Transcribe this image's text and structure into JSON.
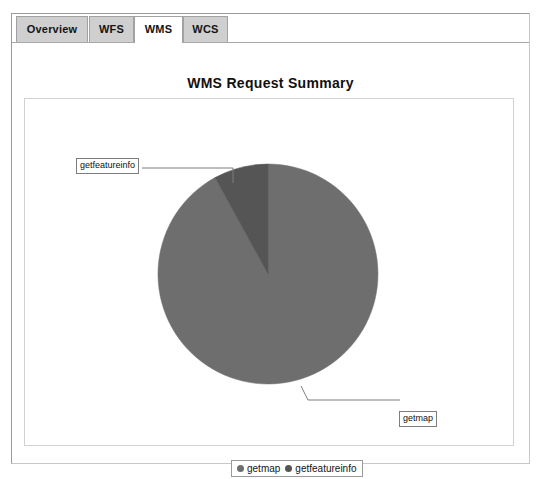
{
  "window": {
    "tabs": [
      {
        "id": "overview",
        "label": "Overview",
        "active": false
      },
      {
        "id": "wfs",
        "label": "WFS",
        "active": false
      },
      {
        "id": "wms",
        "label": "WMS",
        "active": true
      },
      {
        "id": "wcs",
        "label": "WCS",
        "active": false
      }
    ]
  },
  "chart": {
    "title": "WMS Request Summary",
    "callouts": {
      "getfeatureinfo": "getfeatureinfo",
      "getmap": "getmap"
    },
    "legend": [
      {
        "label": "getmap",
        "color": "#6e6e6e"
      },
      {
        "label": "getfeatureinfo",
        "color": "#555555"
      }
    ]
  },
  "chart_data": {
    "type": "pie",
    "title": "WMS Request Summary",
    "categories": [
      "getmap",
      "getfeatureinfo"
    ],
    "values": [
      92,
      8
    ],
    "units": "percent",
    "colors": [
      "#6e6e6e",
      "#555555"
    ],
    "labels": [
      "getmap",
      "getfeatureinfo"
    ],
    "legend_position": "bottom",
    "start_angle": 90,
    "direction": "counterclockwise",
    "grid": false,
    "xlabel": "",
    "ylabel": ""
  }
}
